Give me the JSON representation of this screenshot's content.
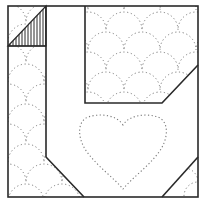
{
  "diagram": {
    "colors": {
      "background": "#ffffff",
      "outline": "#2a2a2a",
      "quilting": "#7a7a7a",
      "hatch": "#2a2a2a"
    },
    "pieces": [
      {
        "name": "outer-frame",
        "shape": "square"
      },
      {
        "name": "top-left-square",
        "shape": "square",
        "fill": "half-hatched triangle"
      },
      {
        "name": "left-strip",
        "shape": "strip with angled bottom"
      },
      {
        "name": "top-right-panel",
        "shape": "rectangle with clipped corner",
        "quilting": "clamshell"
      },
      {
        "name": "center-background",
        "quilting": "heart"
      },
      {
        "name": "bottom-right-corner",
        "shape": "triangle"
      }
    ]
  }
}
